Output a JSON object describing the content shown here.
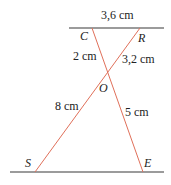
{
  "diagram": {
    "points": {
      "C": "C",
      "R": "R",
      "O": "O",
      "S": "S",
      "E": "E"
    },
    "measures": {
      "CR": "3,6 cm",
      "CO": "2 cm",
      "RO": "3,2 cm",
      "SO": "8 cm",
      "EO": "5 cm"
    },
    "colors": {
      "parallel_lines": "#7a7a7a",
      "transversals": "#e0705a"
    }
  }
}
